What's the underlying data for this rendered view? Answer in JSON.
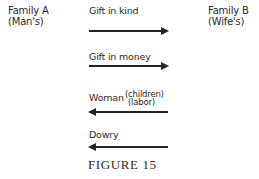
{
  "family_a": {
    "name": "Family A",
    "sub": "(Man's)"
  },
  "family_b": {
    "name": "Family B",
    "sub": "(Wife's)"
  },
  "flows": [
    {
      "label": "Gift in kind",
      "direction": "A-to-B"
    },
    {
      "label": "Gift in money",
      "direction": "A-to-B"
    },
    {
      "label": "Woman",
      "sub1": "(children)",
      "sub2": "(labor)",
      "direction": "B-to-A"
    },
    {
      "label": "Dowry",
      "direction": "B-to-A"
    }
  ],
  "caption": "FIGURE 15"
}
